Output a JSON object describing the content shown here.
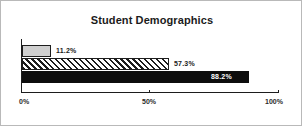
{
  "chart_data": {
    "type": "bar",
    "orientation": "horizontal",
    "title": "Student Demographics",
    "xlabel": "",
    "ylabel": "",
    "categories": [
      "",
      "",
      ""
    ],
    "values": [
      11.2,
      57.3,
      88.2
    ],
    "data_labels": [
      "11.2%",
      "57.3%",
      "88.2%"
    ],
    "label_positions": [
      "outside",
      "outside",
      "inside"
    ],
    "series": [
      {
        "name": "",
        "values": [
          11.2,
          57.3,
          88.2
        ]
      }
    ],
    "bar_styles": [
      "light-gray-fill",
      "diagonal-hatch",
      "solid-black-fill"
    ],
    "xlim": [
      0,
      100
    ],
    "xticks": [
      0,
      50,
      100
    ],
    "xticklabels": [
      "0%",
      "50%",
      "100%"
    ],
    "grid": false,
    "legend": null
  },
  "colors": {
    "frame_border": "#b9b9b9",
    "axis": "#1d1d1d",
    "bar_gray": "#cfcfcf",
    "bar_black": "#0d0d0d",
    "hatch_line": "#1d1d1d",
    "text": "#1b1b1b",
    "label_inside_text": "#ffffff",
    "background": "#ffffff"
  }
}
